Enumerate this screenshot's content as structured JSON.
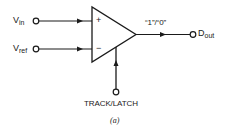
{
  "diagram": {
    "type": "comparator-block-diagram",
    "inputs": [
      {
        "name": "V",
        "subscript": "in",
        "pin": "+",
        "sign_label": "+"
      },
      {
        "name": "V",
        "subscript": "ref",
        "pin": "-",
        "sign_label": "−"
      }
    ],
    "output": {
      "name": "D",
      "subscript": "out",
      "logic_label": "“1”/“0”"
    },
    "control": {
      "label": "TRACK/LATCH"
    },
    "caption": "(a)",
    "colors": {
      "stroke": "#1a1a1a",
      "background": "#ffffff"
    }
  }
}
